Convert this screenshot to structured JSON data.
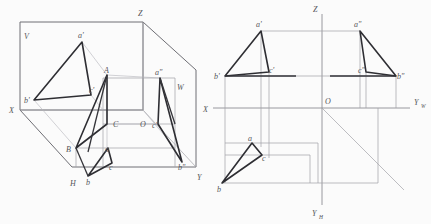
{
  "figure": {
    "colors": {
      "background": "#fbfbfb",
      "axis": "#8d8d93",
      "construction": "#a2a2a8",
      "box": "#6e6e74",
      "triangle": "#2e2e33",
      "label": "#55555a"
    }
  },
  "left_view": {
    "name": "pictorial-three-plane-box",
    "plane_labels": {
      "vertical": "V",
      "horizontal": "H",
      "profile": "W"
    },
    "axis_labels": {
      "x": "X",
      "y": "Y",
      "z": "Z",
      "origin": "O"
    },
    "space_points": [
      {
        "id": "A",
        "label": "A",
        "x": 107,
        "y": 75
      },
      {
        "id": "B",
        "label": "B",
        "x": 76,
        "y": 148
      },
      {
        "id": "C",
        "label": "C",
        "x": 107,
        "y": 124
      }
    ],
    "v_projection": [
      {
        "id": "a1",
        "label": "a'",
        "x": 82,
        "y": 42
      },
      {
        "id": "b1",
        "label": "b'",
        "x": 34,
        "y": 100
      },
      {
        "id": "c1",
        "label": "c'",
        "x": 91,
        "y": 95
      }
    ],
    "h_projection": [
      {
        "id": "a",
        "label": "a",
        "x": 108,
        "y": 148
      },
      {
        "id": "b",
        "label": "b",
        "x": 88,
        "y": 176
      },
      {
        "id": "c",
        "label": "c",
        "x": 112,
        "y": 163
      }
    ],
    "w_projection": [
      {
        "id": "a2",
        "label": "a\"",
        "x": 160,
        "y": 78
      },
      {
        "id": "b2",
        "label": "b\"",
        "x": 182,
        "y": 162
      },
      {
        "id": "c2",
        "label": "c\"",
        "x": 158,
        "y": 124
      }
    ]
  },
  "right_view": {
    "name": "unfolded-three-view-projection",
    "axis_labels": {
      "x": "X",
      "z": "Z",
      "y_w": "Y",
      "y_w_sub": "W",
      "y_h": "Y",
      "y_h_sub": "H",
      "origin": "O"
    },
    "v_projection": [
      {
        "id": "a1",
        "label": "a'",
        "x": 261,
        "y": 31
      },
      {
        "id": "b1",
        "label": "b'",
        "x": 225,
        "y": 76
      },
      {
        "id": "c1",
        "label": "c'",
        "x": 269,
        "y": 72
      }
    ],
    "h_projection": [
      {
        "id": "a",
        "label": "a",
        "x": 252,
        "y": 143
      },
      {
        "id": "b",
        "label": "b",
        "x": 222,
        "y": 183
      },
      {
        "id": "c",
        "label": "c",
        "x": 262,
        "y": 155
      }
    ],
    "w_projection": [
      {
        "id": "a2",
        "label": "a\"",
        "x": 360,
        "y": 31
      },
      {
        "id": "b2",
        "label": "b\"",
        "x": 396,
        "y": 76
      },
      {
        "id": "c2",
        "label": "c\"",
        "x": 366,
        "y": 72
      }
    ],
    "origin": {
      "x": 322,
      "y": 108
    }
  }
}
